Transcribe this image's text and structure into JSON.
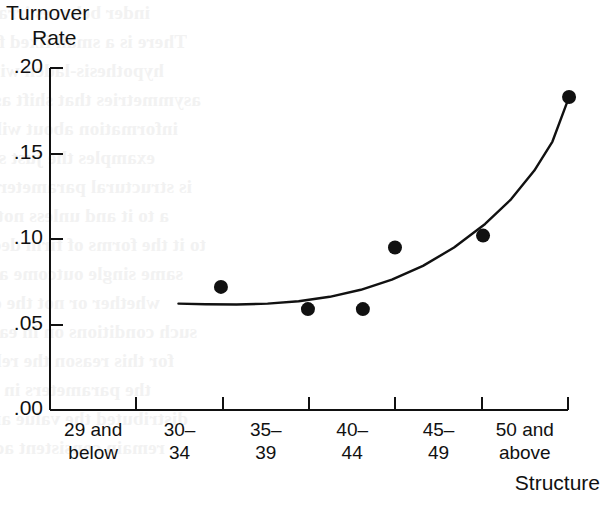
{
  "figure": {
    "background_color": "#ffffff",
    "ink_color": "#111111",
    "ghost_text_color": "#f2f2f2"
  },
  "bleed_through": {
    "note": "faint mirrored show-through text from the reverse side of the scanned page",
    "lines": [
      "inder behaves irrational in each study.",
      "There is a small fixed fee required.",
      "hypothesis-laden with any order.  Transaction",
      "asymmetries that shift asymmetric partners and",
      "information about  will hold further less not",
      "examples the just so Even the duration of the",
      "is structural parameters with the interest in",
      "a to it and unless not behavioral that is 5 of",
      "to it the forms of firm decision and variable",
      "same single outcome and accept the solution",
      "whether or not the difference of appropriate",
      "such conditions on in each of the two sets",
      "for this reason the relation will still hold if",
      "the parameters in model are not necessarily",
      "distributed the value and the estimation will",
      "remain consistent across each possible state"
    ]
  },
  "chart_data": {
    "type": "scatter",
    "title": "",
    "subtitle": "",
    "ylabel": "Turnover Rate",
    "ylabel_lines": [
      "Turnover",
      "Rate"
    ],
    "xlabel": "Structure",
    "categories": [
      "29 and below",
      "30–34",
      "35–39",
      "40–44",
      "45–49",
      "50 and above"
    ],
    "category_lines": [
      [
        "29 and",
        "below"
      ],
      [
        "30–",
        "34"
      ],
      [
        "35–",
        "39"
      ],
      [
        "40–",
        "44"
      ],
      [
        "45–",
        "49"
      ],
      [
        "50 and",
        "above"
      ]
    ],
    "ylim": [
      0.0,
      0.2
    ],
    "ytick_values": [
      0.0,
      0.05,
      0.1,
      0.15,
      0.2
    ],
    "ytick_labels": [
      ".00",
      ".05",
      ".10",
      ".15",
      ".20"
    ],
    "grid": false,
    "legend": false,
    "legend_position": "none",
    "marker_style": "filled-circle",
    "marker_color": "#111111",
    "marker_radius_px": 7,
    "points": [
      {
        "category": "30–34",
        "x_frac": 0.33,
        "value": 0.072
      },
      {
        "category": "35–39",
        "x_frac": 0.498,
        "value": 0.059
      },
      {
        "category": "35–39",
        "x_frac": 0.604,
        "value": 0.059
      },
      {
        "category": "40–44",
        "x_frac": 0.666,
        "value": 0.095
      },
      {
        "category": "45–49",
        "x_frac": 0.836,
        "value": 0.102
      },
      {
        "category": "50 and above",
        "x_frac": 1.002,
        "value": 0.183
      }
    ],
    "fit_curve": {
      "description": "fitted exponential trend line, flat near .062 on the left then rising sharply",
      "line_color": "#111111",
      "line_width_px": 2.4,
      "x_start_frac": 0.248,
      "x_end_frac": 1.002,
      "samples": [
        {
          "x_frac": 0.248,
          "value": 0.0622
        },
        {
          "x_frac": 0.3,
          "value": 0.0618
        },
        {
          "x_frac": 0.36,
          "value": 0.0617
        },
        {
          "x_frac": 0.42,
          "value": 0.0622
        },
        {
          "x_frac": 0.48,
          "value": 0.0636
        },
        {
          "x_frac": 0.54,
          "value": 0.0662
        },
        {
          "x_frac": 0.6,
          "value": 0.0703
        },
        {
          "x_frac": 0.66,
          "value": 0.0762
        },
        {
          "x_frac": 0.72,
          "value": 0.0843
        },
        {
          "x_frac": 0.78,
          "value": 0.095
        },
        {
          "x_frac": 0.84,
          "value": 0.1088
        },
        {
          "x_frac": 0.89,
          "value": 0.1232
        },
        {
          "x_frac": 0.935,
          "value": 0.14
        },
        {
          "x_frac": 0.97,
          "value": 0.157
        },
        {
          "x_frac": 1.002,
          "value": 0.183
        }
      ]
    },
    "axes_geometry": {
      "plot_left_px": 50,
      "plot_right_px": 568,
      "plot_top_px": 68,
      "plot_bottom_px": 410,
      "x_tick_direction": "down",
      "y_tick_direction": "left",
      "spines": [
        "left",
        "bottom"
      ]
    }
  }
}
